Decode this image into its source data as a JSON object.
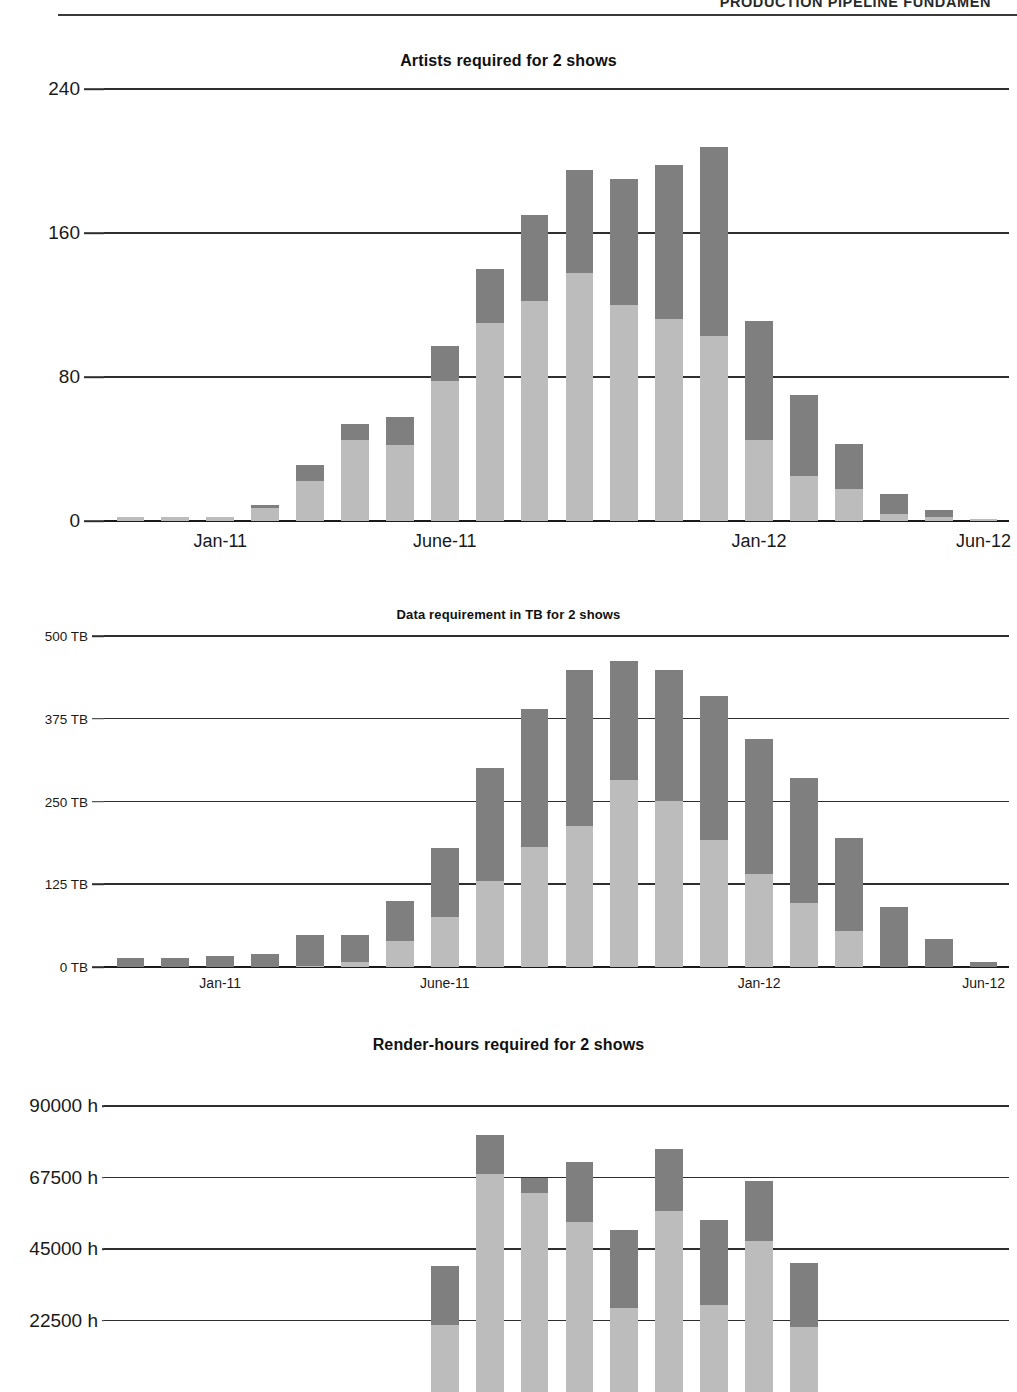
{
  "header": {
    "running_head": "PRODUCTION PIPELINE FUNDAMEN"
  },
  "charts": [
    {
      "title": "Artists required for 2 shows",
      "y_ticks": [
        "240",
        "160",
        "80",
        "0"
      ],
      "x_ticks": [
        "Jan-11",
        "June-11",
        "Jan-12",
        "Jun-12"
      ]
    },
    {
      "title": "Data requirement in TB for 2 shows",
      "y_ticks": [
        "500 TB",
        "375 TB",
        "250 TB",
        "125 TB",
        "0 TB"
      ],
      "x_ticks": [
        "Jan-11",
        "June-11",
        "Jan-12",
        "Jun-12"
      ]
    },
    {
      "title": "Render-hours required for 2 shows",
      "y_ticks": [
        "90000 h",
        "67500 h",
        "45000 h",
        "22500 h"
      ],
      "x_ticks": []
    }
  ],
  "colors": {
    "series_light": "#bcbcbc",
    "series_dark": "#7f7f7f",
    "axis": "#2e2e2e",
    "text": "#1a1a1a"
  },
  "chart_data": [
    {
      "type": "bar",
      "stacked": true,
      "title": "Artists required for 2 shows",
      "xlabel": "",
      "ylabel": "Artists",
      "ylim": [
        0,
        240
      ],
      "yticks": [
        0,
        80,
        160,
        240
      ],
      "ytick_labels": [
        "0",
        "80",
        "160",
        "240"
      ],
      "grid": true,
      "legend": "none",
      "categories": [
        "Nov-10",
        "Dec-10",
        "Jan-11",
        "Feb-11",
        "Mar-11",
        "Apr-11",
        "May-11",
        "June-11",
        "Jul-11",
        "Aug-11",
        "Sep-11",
        "Oct-11",
        "Nov-11",
        "Dec-11",
        "Jan-12",
        "Feb-12",
        "Mar-12",
        "Apr-12",
        "May-12",
        "Jun-12"
      ],
      "xtick_positions": [
        2,
        7,
        14,
        19
      ],
      "xtick_labels": [
        "Jan-11",
        "June-11",
        "Jan-12",
        "Jun-12"
      ],
      "series": [
        {
          "name": "Show 1",
          "values": [
            2,
            2,
            2,
            7,
            22,
            45,
            42,
            78,
            110,
            122,
            138,
            120,
            112,
            103,
            45,
            25,
            18,
            4,
            2,
            1
          ]
        },
        {
          "name": "Show 2",
          "values": [
            0,
            0,
            0,
            2,
            9,
            9,
            16,
            19,
            30,
            48,
            57,
            70,
            86,
            105,
            66,
            45,
            25,
            11,
            4,
            0
          ]
        }
      ],
      "totals": [
        2,
        2,
        2,
        9,
        31,
        54,
        58,
        97,
        140,
        170,
        195,
        190,
        198,
        208,
        111,
        70,
        43,
        15,
        6,
        1
      ]
    },
    {
      "type": "bar",
      "stacked": true,
      "title": "Data requirement in TB for 2 shows",
      "xlabel": "",
      "ylabel": "TB",
      "ylim": [
        0,
        500
      ],
      "yticks": [
        0,
        125,
        250,
        375,
        500
      ],
      "ytick_labels": [
        "0 TB",
        "125 TB",
        "250 TB",
        "375 TB",
        "500 TB"
      ],
      "grid": true,
      "legend": "none",
      "categories": [
        "Nov-10",
        "Dec-10",
        "Jan-11",
        "Feb-11",
        "Mar-11",
        "Apr-11",
        "May-11",
        "June-11",
        "Jul-11",
        "Aug-11",
        "Sep-11",
        "Oct-11",
        "Nov-11",
        "Dec-11",
        "Jan-12",
        "Feb-12",
        "Mar-12",
        "Apr-12",
        "May-12",
        "Jun-12"
      ],
      "xtick_positions": [
        2,
        7,
        14,
        19
      ],
      "xtick_labels": [
        "Jan-11",
        "June-11",
        "Jan-12",
        "Jun-12"
      ],
      "series": [
        {
          "name": "Show 1",
          "values": [
            0,
            0,
            0,
            0,
            2,
            8,
            40,
            75,
            130,
            182,
            213,
            282,
            250,
            192,
            140,
            96,
            55,
            0,
            0,
            0
          ]
        },
        {
          "name": "Show 2",
          "values": [
            14,
            14,
            16,
            20,
            46,
            40,
            60,
            105,
            170,
            207,
            235,
            180,
            198,
            218,
            205,
            190,
            140,
            90,
            42,
            8
          ]
        }
      ],
      "totals": [
        14,
        14,
        16,
        20,
        48,
        48,
        100,
        180,
        300,
        389,
        448,
        462,
        448,
        410,
        345,
        286,
        195,
        90,
        42,
        8
      ]
    },
    {
      "type": "bar",
      "stacked": true,
      "title": "Render-hours required for 2 shows",
      "xlabel": "",
      "ylabel": "Render-hours",
      "ylim": [
        0,
        90000
      ],
      "yticks": [
        22500,
        45000,
        67500,
        90000
      ],
      "ytick_labels": [
        "22500 h",
        "45000 h",
        "67500 h",
        "90000 h"
      ],
      "grid": true,
      "legend": "none",
      "note": "bottom of figure is cropped by the page edge",
      "categories": [
        "Nov-10",
        "Dec-10",
        "Jan-11",
        "Feb-11",
        "Mar-11",
        "Apr-11",
        "May-11",
        "June-11",
        "Jul-11",
        "Aug-11",
        "Sep-11",
        "Oct-11",
        "Nov-11",
        "Dec-11",
        "Jan-12",
        "Feb-12",
        "Mar-12",
        "Apr-12",
        "May-12",
        "Jun-12"
      ],
      "xtick_positions": [
        2,
        7,
        14,
        19
      ],
      "xtick_labels": [
        "Jan-11",
        "June-11",
        "Jan-12",
        "Jun-12"
      ],
      "series": [
        {
          "name": "Show 1",
          "values": [
            0,
            0,
            0,
            0,
            0,
            0,
            0,
            21000,
            68500,
            62500,
            53500,
            26500,
            57000,
            27500,
            47500,
            20500,
            0,
            0,
            0,
            0
          ]
        },
        {
          "name": "Show 2",
          "values": [
            0,
            0,
            0,
            0,
            0,
            0,
            0,
            18500,
            12500,
            5000,
            19000,
            24500,
            19500,
            26500,
            19000,
            20000,
            0,
            0,
            0,
            0
          ]
        }
      ],
      "totals": [
        0,
        0,
        0,
        0,
        0,
        0,
        0,
        39500,
        81000,
        67500,
        72500,
        51000,
        76500,
        54000,
        66500,
        40500,
        0,
        0,
        0,
        0
      ]
    }
  ]
}
